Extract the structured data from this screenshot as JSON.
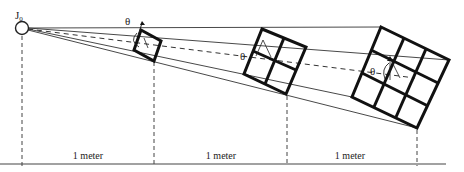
{
  "diagram": {
    "origin_label": "J",
    "origin_subscript": "0",
    "angle_symbol": "θ",
    "distance_labels": [
      "1 meter",
      "1 meter",
      "1 meter"
    ],
    "grids": [
      {
        "name": "small",
        "divisions": 1
      },
      {
        "name": "medium",
        "divisions": 2
      },
      {
        "name": "large",
        "divisions": 3
      }
    ],
    "colors": {
      "line": "#222222",
      "box": "#111111",
      "background": "#ffffff"
    }
  }
}
